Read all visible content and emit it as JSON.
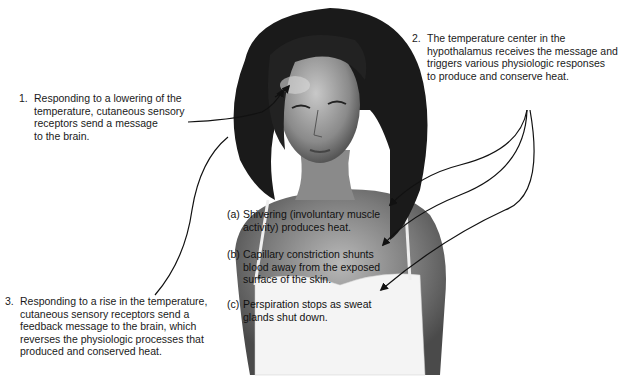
{
  "figure": {
    "steps": [
      {
        "number": "1.",
        "text": "Responding to a lowering of the\ntemperature, cutaneous sensory\nreceptors send a message\nto the brain."
      },
      {
        "number": "2.",
        "text": "The temperature center in the\nhypothalamus receives the message and\ntriggers various physiologic responses\nto produce and conserve heat."
      },
      {
        "number": "3.",
        "text": "Responding to a rise in the temperature,\ncutaneous sensory receptors send a\nfeedback message to the brain, which\nreverses the physiologic processes that\nproduced and conserved heat."
      }
    ],
    "responses": [
      {
        "letter": "(a)",
        "text": "Shivering (involuntary muscle\nactivity) produces heat."
      },
      {
        "letter": "(b)",
        "text": "Capillary constriction shunts\nblood away from the exposed\nsurface of the skin."
      },
      {
        "letter": "(c)",
        "text": "Perspiration stops as sweat\nglands shut down."
      }
    ]
  }
}
